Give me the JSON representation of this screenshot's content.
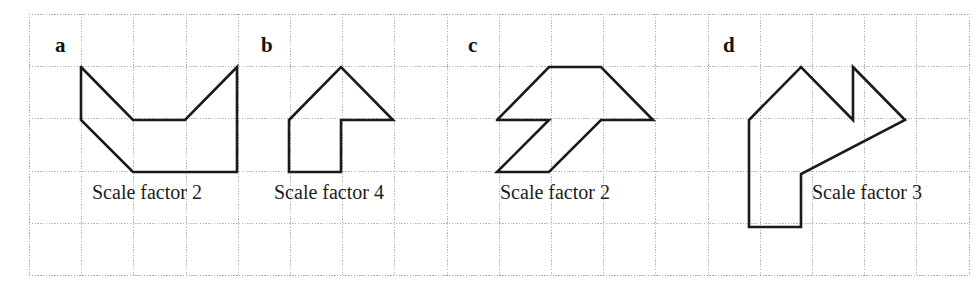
{
  "figure": {
    "width": 976,
    "height": 297,
    "background": "#ffffff"
  },
  "grid": {
    "origin_x": 29,
    "origin_y": 14,
    "cell_size": 52.2,
    "cols": 18,
    "rows": 5,
    "line_color": "#b9b9bd",
    "border_color": "#a8a8ae",
    "style": "dotted"
  },
  "style": {
    "shape_stroke": "#1a1a1a",
    "shape_stroke_width": 2.6,
    "label_color": "#121212",
    "caption_color": "#1d1d1d"
  },
  "shapes": [
    {
      "id": "a",
      "label": "a",
      "label_x": 55,
      "label_y": 52,
      "caption": "Scale factor 2",
      "caption_x": 92,
      "caption_y": 199,
      "points": "81,67 81,120 133,172 237,172 237,67 185,120 133,120 81,67",
      "closed": true
    },
    {
      "id": "b",
      "label": "b",
      "label_x": 261,
      "label_y": 52,
      "caption": "Scale factor 4",
      "caption_x": 274,
      "caption_y": 199,
      "points": "289,120 341,67 393,120 341,120 341,172 289,172 289,120",
      "closed": true
    },
    {
      "id": "c",
      "label": "c",
      "label_x": 468,
      "label_y": 52,
      "caption": "Scale factor 2",
      "caption_x": 500,
      "caption_y": 199,
      "points": "497,120 549,67 601,67 653,120 601,120 549,172 497,172 549,120 497,120",
      "closed": true
    },
    {
      "id": "d",
      "label": "d",
      "label_x": 723,
      "label_y": 52,
      "caption": "Scale factor 3",
      "caption_x": 812,
      "caption_y": 199,
      "points": "749,120 801,67 853,120 853,67 905,120 801,174 801,227 749,227 749,120",
      "closed": true
    }
  ]
}
